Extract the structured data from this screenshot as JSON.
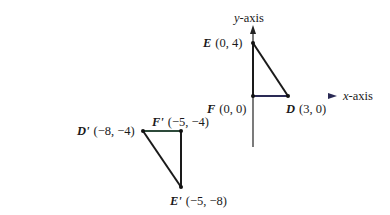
{
  "diagram": {
    "axes": {
      "x_label_var": "x",
      "x_label_suffix": "-axis",
      "y_label_var": "y",
      "y_label_suffix": "-axis",
      "x_axis_color": "#3c8a3c",
      "axis_color": "#222222"
    },
    "original_triangle": {
      "points": [
        {
          "name": "E",
          "coords": "(0, 4)",
          "x": 0,
          "y": 4
        },
        {
          "name": "F",
          "coords": "(0, 0)",
          "x": 0,
          "y": 0
        },
        {
          "name": "D",
          "coords": "(3, 0)",
          "x": 3,
          "y": 0
        }
      ]
    },
    "image_triangle": {
      "points": [
        {
          "name": "D'",
          "coords": "(−8, −4)",
          "x": -8,
          "y": -4
        },
        {
          "name": "F'",
          "coords": "(−5, −4)",
          "x": -5,
          "y": -4
        },
        {
          "name": "E'",
          "coords": "(−5, −8)",
          "x": -5,
          "y": -8
        }
      ]
    }
  }
}
